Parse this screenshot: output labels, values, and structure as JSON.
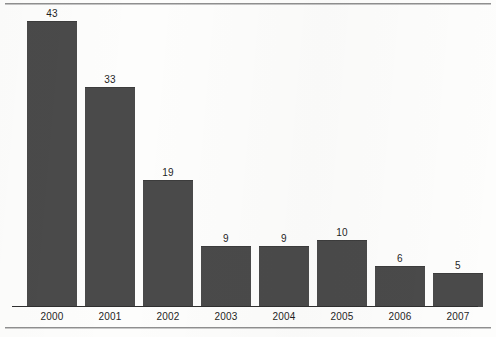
{
  "chart_data": {
    "type": "bar",
    "title": "",
    "subtitle": "",
    "xlabel": "",
    "ylabel": "",
    "categories": [
      "2000",
      "2001",
      "2002",
      "2003",
      "2004",
      "2005",
      "2006",
      "2007"
    ],
    "values": [
      43,
      33,
      19,
      9,
      9,
      10,
      6,
      5
    ],
    "value_labels": [
      "43",
      "33",
      "19",
      "9",
      "9",
      "10",
      "6",
      "5"
    ],
    "ylim": [
      0,
      43
    ],
    "grid": false,
    "legend": null,
    "legend_position": "none",
    "annotations": [],
    "bar_color": "#4a4a4a",
    "axis_color": "#2f2f2f",
    "frame_color": "#8f8f8f",
    "background_color": "#fdfdfc",
    "label_color": "#1f1f1f",
    "data_labels_shown": true,
    "y_axis_shown": false,
    "y_tick_labels": []
  },
  "layout": {
    "plot_left": 12,
    "plot_right": 478,
    "baseline_y": 306,
    "frame_top_y": 3,
    "frame_bottom_y": 327,
    "bar_width": 50,
    "slot_width": 58,
    "first_bar_left": 27,
    "px_per_unit": 6.65
  }
}
